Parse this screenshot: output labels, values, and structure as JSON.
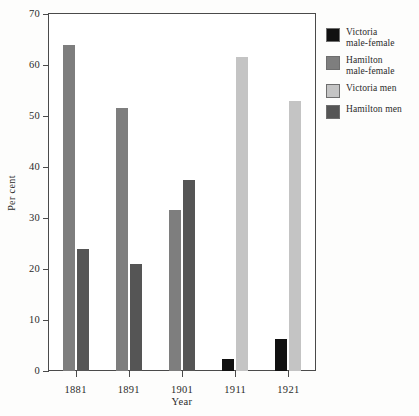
{
  "chart_data": {
    "type": "bar",
    "title": "",
    "xlabel": "Year",
    "ylabel": "Per cent",
    "categories": [
      "1881",
      "1891",
      "1901",
      "1911",
      "1921"
    ],
    "ylim": [
      0,
      70
    ],
    "yticks": [
      0,
      10,
      20,
      30,
      40,
      50,
      60,
      70
    ],
    "ytick_labels": [
      "0",
      "10",
      "20",
      "30",
      "40",
      "50",
      "60",
      "70"
    ],
    "grid": false,
    "legend_position": "right",
    "series": [
      {
        "name": "Victoria male-female",
        "legend_label": "Victoria\nmale-female",
        "color": "#111111",
        "values": [
          null,
          null,
          null,
          2.3,
          6.2
        ]
      },
      {
        "name": "Hamilton male-female",
        "legend_label": "Hamilton\nmale-female",
        "color": "#7e7e7e",
        "values": [
          64.0,
          51.5,
          31.5,
          null,
          null
        ]
      },
      {
        "name": "Victoria men",
        "legend_label": "Victoria men",
        "color": "#c4c4c4",
        "values": [
          null,
          null,
          null,
          61.5,
          53.0
        ]
      },
      {
        "name": "Hamilton men",
        "legend_label": "Hamilton men",
        "color": "#555555",
        "values": [
          23.9,
          20.9,
          37.5,
          null,
          null
        ]
      }
    ]
  },
  "axes": {
    "ylabel": "Per cent",
    "xlabel": "Year",
    "ytick_labels": [
      "0",
      "10",
      "20",
      "30",
      "40",
      "50",
      "60",
      "70"
    ],
    "xtick_labels": [
      "1881",
      "1891",
      "1901",
      "1911",
      "1921"
    ]
  },
  "legend": {
    "entries": [
      {
        "label": "Victoria\nmale-female",
        "color": "#111111"
      },
      {
        "label": "Hamilton\nmale-female",
        "color": "#7e7e7e"
      },
      {
        "label": "Victoria men",
        "color": "#c4c4c4"
      },
      {
        "label": "Hamilton men",
        "color": "#555555"
      }
    ]
  }
}
